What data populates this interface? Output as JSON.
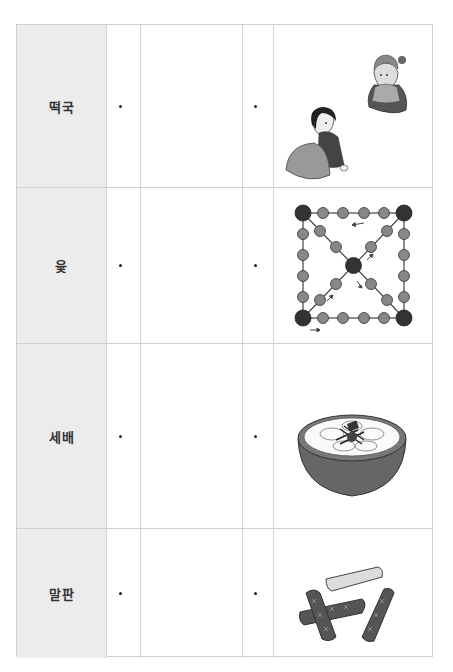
{
  "worksheet": {
    "rows": [
      {
        "label": "떡국",
        "image": "sebae-bowing-illustration"
      },
      {
        "label": "윷",
        "image": "yut-board-illustration"
      },
      {
        "label": "세배",
        "image": "tteokguk-bowl-illustration"
      },
      {
        "label": "말판",
        "image": "yut-sticks-illustration"
      }
    ]
  },
  "colors": {
    "label_fill": "#ececec",
    "grid_line": "#cfcfcf",
    "ink": "#333333"
  }
}
